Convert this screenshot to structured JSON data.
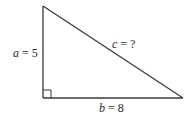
{
  "diagram": {
    "vertices": {
      "top": [
        43,
        6
      ],
      "right_angle": [
        43,
        98
      ],
      "bottom_right": [
        183,
        98
      ]
    },
    "right_angle_marker_size": 8,
    "labels": {
      "a": {
        "variable": "a",
        "equals": " = ",
        "value": "5",
        "x": 13,
        "y": 57
      },
      "b": {
        "variable": "b",
        "equals": " = ",
        "value": "8",
        "x": 99,
        "y": 112
      },
      "c": {
        "variable": "c",
        "equals": " = ",
        "value": "?",
        "x": 112,
        "y": 48
      }
    },
    "colors": {
      "line": "#3a3a3a",
      "text": "#2a2a2a",
      "background": "#ffffff"
    }
  }
}
